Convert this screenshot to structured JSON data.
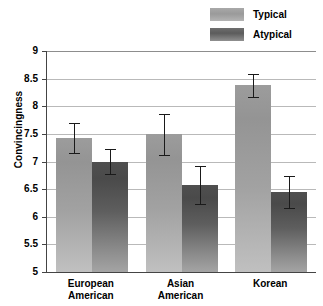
{
  "chart_data": {
    "type": "bar",
    "title": "",
    "xlabel": "",
    "ylabel": "Convincingness",
    "ylim": [
      5,
      9
    ],
    "ytick_labels": [
      "9",
      "8.5",
      "8",
      "7.5",
      "7",
      "6.5",
      "6",
      "5.5",
      "5"
    ],
    "ytick_values": [
      9,
      8.5,
      8,
      7.5,
      7,
      6.5,
      6,
      5.5,
      5
    ],
    "grid": true,
    "legend_position": "top-right",
    "categories": [
      "European American",
      "Asian American",
      "Korean"
    ],
    "series": [
      {
        "name": "Typical",
        "color": "#9c9c9c",
        "values": [
          7.43,
          7.49,
          8.38
        ],
        "errors": [
          0.27,
          0.37,
          0.21
        ]
      },
      {
        "name": "Atypical",
        "color": "#4f4f4f",
        "values": [
          7.0,
          6.57,
          6.44
        ],
        "errors": [
          0.23,
          0.34,
          0.29
        ]
      }
    ]
  },
  "legend": {
    "items": [
      {
        "label": "Typical",
        "swatch": "typical-swatch"
      },
      {
        "label": "Atypical",
        "swatch": "atypical-swatch"
      }
    ]
  },
  "axes": {
    "y_title": "Convincingness",
    "y_ticks": [
      "9",
      "8.5",
      "8",
      "7.5",
      "7",
      "6.5",
      "6",
      "5.5",
      "5"
    ],
    "x_ticks": [
      "European\nAmerican",
      "Asian\nAmerican",
      "Korean"
    ]
  }
}
